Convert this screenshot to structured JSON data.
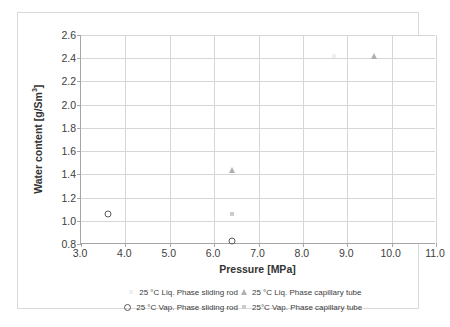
{
  "chart_data": {
    "type": "scatter",
    "title": "",
    "xlabel": "Pressure [MPa]",
    "ylabel_text": "Water content [g/Sm",
    "ylabel_sup": "3",
    "ylabel_tail": "]",
    "ylabel": "Water content [g/Sm³]",
    "xlim": [
      3.0,
      11.0
    ],
    "ylim": [
      0.8,
      2.6
    ],
    "xticks": [
      "3.0",
      "4.0",
      "5.0",
      "6.0",
      "7.0",
      "8.0",
      "9.0",
      "10.0",
      "11.0"
    ],
    "xtick_values": [
      3.0,
      4.0,
      5.0,
      6.0,
      7.0,
      8.0,
      9.0,
      10.0,
      11.0
    ],
    "yticks": [
      "0.8",
      "1.0",
      "1.2",
      "1.4",
      "1.6",
      "1.8",
      "2.0",
      "2.2",
      "2.4",
      "2.6"
    ],
    "ytick_values": [
      0.8,
      1.0,
      1.2,
      1.4,
      1.6,
      1.8,
      2.0,
      2.2,
      2.4,
      2.6
    ],
    "grid": {
      "horizontal": true,
      "vertical": true,
      "color": "#d6d6d6"
    },
    "legend_position": "bottom",
    "series": [
      {
        "name": "25 °C Liq. Phase sliding rod",
        "marker": "faint-square",
        "color": "#efefef",
        "points": [
          {
            "x": 8.7,
            "y": 2.42
          }
        ]
      },
      {
        "name": "25 °C Liq. Phase capillary tube",
        "marker": "triangle",
        "color": "#b0b0b0",
        "points": [
          {
            "x": 6.4,
            "y": 1.44
          },
          {
            "x": 9.6,
            "y": 2.42
          }
        ]
      },
      {
        "name": "25 °C Vap. Phase sliding rod",
        "marker": "open-circle",
        "color": "#595959",
        "points": [
          {
            "x": 3.6,
            "y": 1.06
          },
          {
            "x": 6.4,
            "y": 0.83
          }
        ]
      },
      {
        "name": "25°C Vap. Phase capillary tube",
        "marker": "square",
        "color": "#cccccc",
        "points": [
          {
            "x": 6.4,
            "y": 1.06
          }
        ]
      }
    ]
  },
  "legend": {
    "rows": [
      [
        {
          "series_index": 0,
          "label": "25 °C Liq. Phase sliding rod",
          "marker": "faint-square"
        },
        {
          "series_index": 1,
          "label": "25 °C Liq. Phase capillary tube",
          "marker": "triangle"
        }
      ],
      [
        {
          "series_index": 2,
          "label": "25 °C Vap. Phase sliding rod",
          "marker": "open-circle"
        },
        {
          "series_index": 3,
          "label": "25°C Vap. Phase capillary tube",
          "marker": "square"
        }
      ]
    ]
  }
}
